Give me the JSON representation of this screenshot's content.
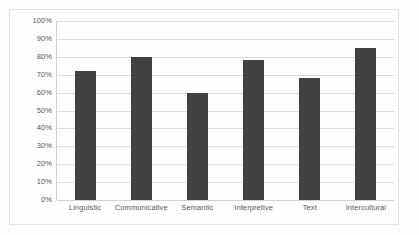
{
  "chart_data": {
    "type": "bar",
    "title": "",
    "subtitle": "",
    "xlabel": "",
    "ylabel": "",
    "categories": [
      "Linguistic",
      "Communicative",
      "Semantic",
      "Interpretive",
      "Text",
      "Intercultural"
    ],
    "values": [
      72,
      80,
      60,
      78,
      68,
      85
    ],
    "ylim": [
      0,
      100
    ],
    "ytick_labels": [
      "0%",
      "10%",
      "20%",
      "30%",
      "40%",
      "50%",
      "60%",
      "70%",
      "80%",
      "90%",
      "100%"
    ],
    "ytick_values": [
      0,
      10,
      20,
      30,
      40,
      50,
      60,
      70,
      80,
      90,
      100
    ],
    "grid": true,
    "legend": null,
    "legend_position": "none",
    "series": [
      {
        "name": "",
        "values": [
          72,
          80,
          60,
          78,
          68,
          85
        ]
      }
    ],
    "bar_color": "#414141",
    "gridline_color": "#dddddd",
    "axis_color": "#d2d2d2",
    "label_color": "#58585a",
    "background_color": "#ffffff",
    "border_color": "#e3e3e3"
  }
}
